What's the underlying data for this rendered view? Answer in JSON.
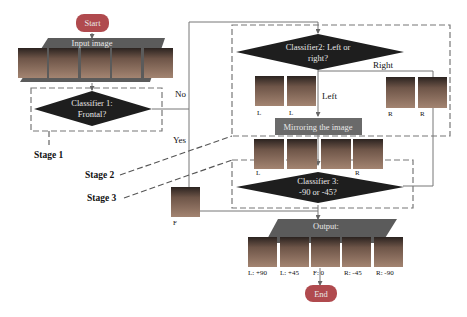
{
  "diagram": {
    "start": "Start",
    "end": "End",
    "input": "Input image",
    "output": "Output:",
    "classifier1": [
      "Classifier 1:",
      "Frontal?"
    ],
    "classifier2": [
      "Classifier2: Left or",
      "right?"
    ],
    "classifier3": [
      "Classifier 3:",
      "-90 or -45?"
    ],
    "mirror": "Mirroring the image",
    "edges": {
      "no": "No",
      "yes": "Yes",
      "left": "Left",
      "right": "Right"
    },
    "stages": [
      "Stage 1",
      "Stage 2",
      "Stage 3"
    ],
    "left_faces": [
      "L",
      "L"
    ],
    "right_faces": [
      "R",
      "R"
    ],
    "mirrored_faces": [
      "L",
      "L",
      "R",
      "R"
    ],
    "frontal_face": "F",
    "output_labels": [
      "L: +90",
      "L: +45",
      "F: 0",
      "R: -45",
      "R: -90"
    ],
    "colors": {
      "terminal": "#b04a4e",
      "parallelogram": "#5b5b5b",
      "diamond": "#1e1e1e",
      "mirror_box": "#6a6a6a",
      "line": "#777777"
    }
  }
}
